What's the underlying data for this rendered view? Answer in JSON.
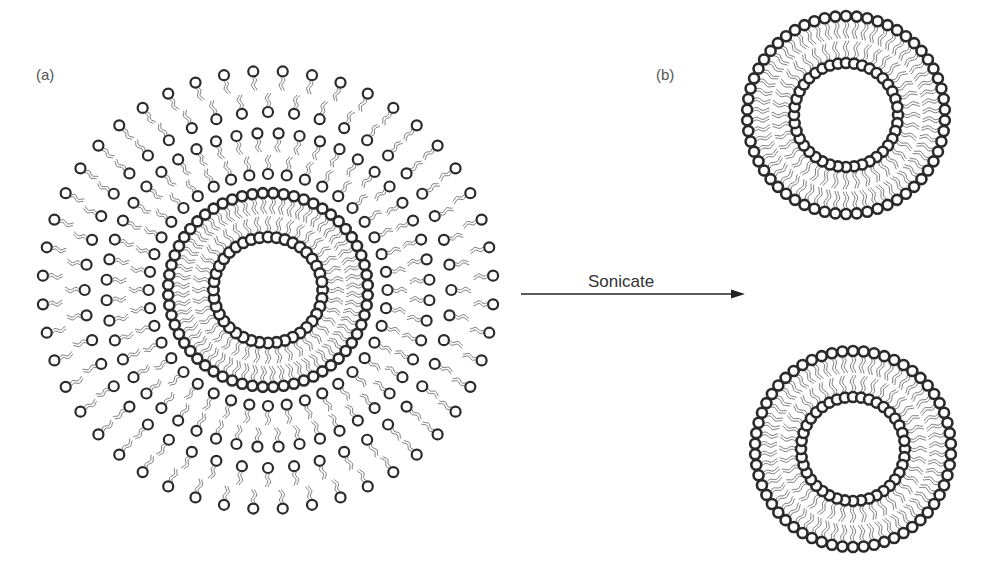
{
  "figure": {
    "width": 991,
    "height": 571,
    "colors": {
      "background": "#ffffff",
      "head_stroke": "#2a2a2a",
      "tail_stroke": "#7a7a7a",
      "arrow": "#222222",
      "label_text": "#555555"
    }
  },
  "panel_a": {
    "label": "(a)",
    "label_pos": {
      "x": 36,
      "y": 66
    },
    "title": "Multilamellar liposome",
    "center": {
      "x": 268,
      "y": 290
    },
    "bilayers": [
      {
        "inner_r": 53,
        "outer_r": 97,
        "inner_count": 40,
        "outer_count": 60,
        "inner_head_r": 5.2,
        "outer_head_r": 5,
        "head_stroke": 2.6,
        "sx": 1.03,
        "sy": 1.0
      },
      {
        "inner_r": 116,
        "outer_r": 157,
        "inner_count": 40,
        "outer_count": 48,
        "inner_head_r": 5,
        "outer_head_r": 5,
        "head_stroke": 2.2,
        "sx": 1.03,
        "sy": 1.0
      },
      {
        "inner_r": 178,
        "outer_r": 219,
        "inner_count": 44,
        "outer_count": 48,
        "inner_head_r": 5,
        "outer_head_r": 5,
        "head_stroke": 2.2,
        "sx": 1.03,
        "sy": 1.0
      }
    ]
  },
  "arrow": {
    "label": "Sonicate",
    "label_pos": {
      "x": 588,
      "y": 272
    },
    "x1": 521,
    "y1": 294,
    "x2": 745,
    "y2": 294
  },
  "panel_b": {
    "label": "(b)",
    "label_pos": {
      "x": 656,
      "y": 66
    },
    "title": "Unilamellar vesicles",
    "vesicles": [
      {
        "name": "vesicle-top",
        "center": {
          "x": 846,
          "y": 115
        },
        "inner_r": 52,
        "outer_r": 99,
        "inner_count": 40,
        "outer_count": 58,
        "head_r": 5,
        "head_stroke": 2.6
      },
      {
        "name": "vesicle-bottom",
        "center": {
          "x": 853,
          "y": 449
        },
        "inner_r": 52,
        "outer_r": 98,
        "inner_count": 40,
        "outer_count": 58,
        "head_r": 5,
        "head_stroke": 2.6
      }
    ]
  }
}
